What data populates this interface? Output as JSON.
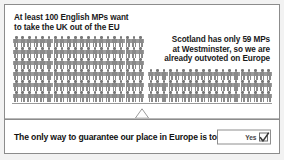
{
  "leaflet": {
    "panel": {
      "caption_left": "At least 100 English MPs want\nto take the UK out of the EU",
      "caption_right": "Scotland has only 59 MPs\nat Westminster, so we are\nalready outvoted on Europe",
      "fulcrum_icon": "triangle-fulcrum-icon",
      "beam_icon": "balance-beam-icon"
    },
    "vote_bar": {
      "text": "The only way to guarantee our place in Europe is to vote",
      "ballot_label": "Yes",
      "ballot_mark": "check-mark-icon"
    },
    "colors": {
      "figure_fill": "#8a8a8a",
      "figure_head": "#777777",
      "border": "#8c8c8c",
      "background": "#ffffff",
      "page_background": "#f2f2f2",
      "text": "#111111"
    }
  },
  "chart_data": {
    "type": "pictogram",
    "unit": "1 figure = 1 MP",
    "series": [
      {
        "name": "English MPs wanting to take the UK out of the EU",
        "label": "At least 100 English MPs want to take the UK out of the EU",
        "value": 120,
        "side": "left",
        "rows": 6,
        "columns": 20
      },
      {
        "name": "Scottish MPs at Westminster",
        "label": "Scotland has only 59 MPs at Westminster, so we are already outvoted on Europe",
        "value": 57,
        "side": "right",
        "rows": 3,
        "columns": 19
      }
    ],
    "annotation": "Seesaw balance tipped showing Scotland is outvoted",
    "legend": "none",
    "grid": false
  }
}
